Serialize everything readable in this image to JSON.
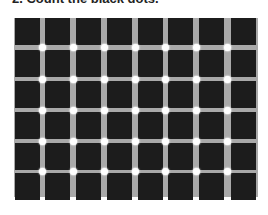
{
  "title": "2. Count the black dots.",
  "figure": {
    "columns": 8,
    "rows": 6,
    "cell_size": 26,
    "bar_width": 5,
    "colors": {
      "square": "#1c1c1c",
      "bar": "#a9a9a9",
      "dot": "#ffffff",
      "background": "#ffffff"
    },
    "dot_count_visible": 35
  }
}
